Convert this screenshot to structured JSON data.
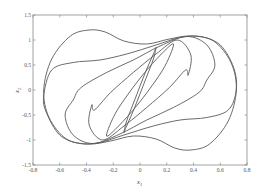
{
  "chart_data": {
    "type": "line",
    "title": "",
    "xlabel": "x",
    "xlabel_subscript": "1",
    "ylabel": "x",
    "ylabel_subscript": "2",
    "xlim": [
      -0.8,
      0.8
    ],
    "ylim": [
      -1.5,
      1.5
    ],
    "xticks": [
      -0.8,
      -0.6,
      -0.4,
      -0.2,
      0,
      0.2,
      0.4,
      0.6,
      0.8
    ],
    "xtick_labels": [
      "-0.8",
      "-0.6",
      "-0.4",
      "-0.2",
      "0",
      "0.2",
      "0.4",
      "0.6",
      "0.8"
    ],
    "yticks": [
      1.5,
      1,
      0.5,
      0,
      -0.5,
      -1,
      -1.5
    ],
    "ytick_labels": [
      "1.5",
      "1",
      "0.5",
      "0",
      "-0.5",
      "-1",
      "-1.5"
    ],
    "grid": false,
    "legend": null,
    "series": [
      {
        "name": "orbit-1 (outermost)",
        "x": [
          -0.72,
          -0.66,
          -0.52,
          -0.38,
          -0.26,
          -0.12,
          0.05,
          0.22,
          0.38,
          0.55,
          0.68,
          0.72,
          0.66,
          0.52,
          0.38,
          0.26,
          0.12,
          -0.05,
          -0.22,
          -0.38,
          -0.55,
          -0.68,
          -0.72
        ],
        "y": [
          0.0,
          0.62,
          1.08,
          1.2,
          1.16,
          0.98,
          0.92,
          1.02,
          1.08,
          0.98,
          0.55,
          0.0,
          -0.62,
          -1.08,
          -1.2,
          -1.16,
          -0.98,
          -0.92,
          -1.02,
          -1.08,
          -0.98,
          -0.55,
          0.0
        ]
      },
      {
        "name": "orbit-2",
        "x": [
          -0.72,
          -0.66,
          -0.5,
          -0.3,
          -0.1,
          0.12,
          0.3,
          0.45,
          0.6,
          0.7,
          0.72,
          0.66,
          0.5,
          0.3,
          0.1,
          -0.12,
          -0.3,
          -0.45,
          -0.6,
          -0.7,
          -0.72
        ],
        "y": [
          -0.12,
          0.4,
          0.55,
          0.6,
          0.72,
          0.9,
          1.05,
          1.07,
          0.9,
          0.45,
          0.0,
          -0.4,
          -0.55,
          -0.6,
          -0.72,
          -0.9,
          -1.05,
          -1.07,
          -0.9,
          -0.45,
          -0.12
        ]
      },
      {
        "name": "orbit-3",
        "x": [
          -0.5,
          -0.44,
          -0.25,
          -0.05,
          0.15,
          0.35,
          0.5,
          0.56,
          0.5,
          0.44,
          0.25,
          0.05,
          -0.15,
          -0.35,
          -0.5,
          -0.56,
          -0.5
        ],
        "y": [
          -0.2,
          0.05,
          0.35,
          0.6,
          0.88,
          1.07,
          0.9,
          0.5,
          0.2,
          -0.05,
          -0.35,
          -0.6,
          -0.88,
          -1.07,
          -0.9,
          -0.5,
          -0.2
        ]
      },
      {
        "name": "orbit-4",
        "x": [
          -0.34,
          -0.22,
          -0.05,
          0.12,
          0.28,
          0.38,
          0.36,
          0.34,
          0.22,
          0.05,
          -0.12,
          -0.28,
          -0.38,
          -0.36,
          -0.34
        ],
        "y": [
          -0.4,
          -0.05,
          0.35,
          0.72,
          1.0,
          0.7,
          0.3,
          0.4,
          0.05,
          -0.35,
          -0.72,
          -1.0,
          -0.7,
          -0.3,
          -0.4
        ]
      },
      {
        "name": "orbit-5",
        "x": [
          -0.2,
          -0.12,
          0.02,
          0.16,
          0.25,
          0.2,
          0.12,
          -0.02,
          -0.16,
          -0.25,
          -0.2
        ],
        "y": [
          -0.55,
          -0.2,
          0.3,
          0.72,
          0.92,
          0.55,
          0.2,
          -0.3,
          -0.72,
          -0.92,
          -0.55
        ]
      },
      {
        "name": "orbit-6 (innermost)",
        "x": [
          -0.1,
          -0.04,
          0.04,
          0.1,
          0.12,
          0.1,
          0.04,
          -0.04,
          -0.1,
          -0.12,
          -0.1
        ],
        "y": [
          -0.62,
          -0.2,
          0.35,
          0.72,
          0.85,
          0.62,
          0.2,
          -0.35,
          -0.72,
          -0.85,
          -0.62
        ]
      }
    ]
  },
  "axes": {
    "x_label": "x",
    "x_label_sub": "1",
    "y_label": "x",
    "y_label_sub": "2"
  }
}
